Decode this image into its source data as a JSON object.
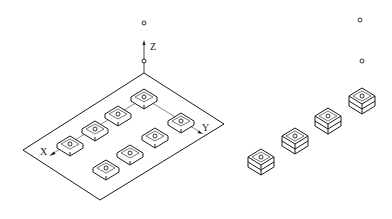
{
  "figure": {
    "left_panel": {
      "axis_labels": {
        "x": "X",
        "y": "Y",
        "z": "Z"
      },
      "plate": {
        "corners": [
          [
            144,
            73
          ],
          [
            224,
            124
          ],
          [
            100,
            200
          ],
          [
            23,
            150
          ]
        ]
      },
      "z_markers": [
        [
          144,
          23
        ],
        [
          144,
          61
        ]
      ],
      "pads_axis_x": [
        [
          70,
          145
        ],
        [
          95,
          130
        ],
        [
          118,
          115
        ],
        [
          144,
          98
        ]
      ],
      "pad_axis_y": [
        181,
        122
      ],
      "pads_lower_row": [
        [
          106,
          169
        ],
        [
          130,
          154
        ],
        [
          155,
          137
        ]
      ]
    },
    "right_panel": {
      "stacks": [
        [
          261,
          161
        ],
        [
          295,
          140
        ],
        [
          328,
          119
        ],
        [
          362,
          98
        ]
      ],
      "markers": [
        [
          360,
          20
        ],
        [
          362,
          61
        ]
      ]
    },
    "colors": {
      "line": "#1a1a1a",
      "background": "#ffffff"
    }
  }
}
